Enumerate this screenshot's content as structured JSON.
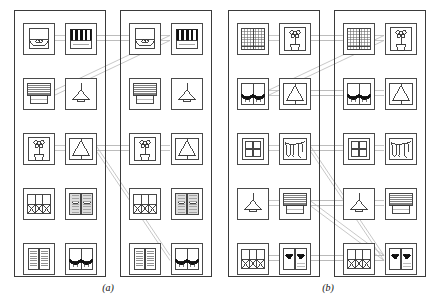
{
  "figure": {
    "type": "retrieval-results-comparison",
    "background_color": "#ffffff",
    "line_color": "#b9b9b9",
    "stroke_color": "#3a3a3a",
    "width": 440,
    "height": 302
  },
  "captions": [
    {
      "id": "a",
      "label": "(a)",
      "x": 108,
      "y": 282
    },
    {
      "id": "b",
      "label": "(b)",
      "x": 328,
      "y": 282
    }
  ],
  "panels": [
    {
      "id": "a",
      "label": "(a)",
      "columns": [
        {
          "id": "a-left",
          "name": "panel-a-query-column",
          "x": 14,
          "y": 10,
          "w": 90,
          "h": 265,
          "cells": [
            {
              "row": 0,
              "col": 0,
              "icon": "roman-shade-scalloped-icon",
              "label": "roman shade"
            },
            {
              "row": 0,
              "col": 1,
              "icon": "striped-awning-black-icon",
              "label": "black striped awning"
            },
            {
              "row": 1,
              "col": 0,
              "icon": "venetian-blind-slats-icon",
              "label": "venetian blind"
            },
            {
              "row": 1,
              "col": 1,
              "icon": "pendant-lamp-icon",
              "label": "pendant lamp"
            },
            {
              "row": 2,
              "col": 0,
              "icon": "potted-flower-window-icon",
              "label": "potted flower in window"
            },
            {
              "row": 2,
              "col": 1,
              "icon": "tent-awning-triangle-icon",
              "label": "triangular tent awning"
            },
            {
              "row": 3,
              "col": 0,
              "icon": "lattice-cross-window-icon",
              "label": "lattice cross window"
            },
            {
              "row": 3,
              "col": 1,
              "icon": "textured-drapes-pair-icon",
              "label": "textured drape pair"
            },
            {
              "row": 4,
              "col": 0,
              "icon": "louvered-shutters-icon",
              "label": "louvered shutters"
            },
            {
              "row": 4,
              "col": 1,
              "icon": "swag-valance-pair-icon",
              "label": "swag valance pair"
            }
          ]
        },
        {
          "id": "a-right",
          "name": "panel-a-result-column",
          "x": 120,
          "y": 10,
          "w": 90,
          "h": 265,
          "cells": [
            {
              "row": 0,
              "col": 0,
              "icon": "roman-shade-scalloped-icon",
              "label": "roman shade"
            },
            {
              "row": 0,
              "col": 1,
              "icon": "striped-awning-black-icon",
              "label": "black striped awning"
            },
            {
              "row": 1,
              "col": 0,
              "icon": "venetian-blind-slats-icon",
              "label": "venetian blind"
            },
            {
              "row": 1,
              "col": 1,
              "icon": "pendant-lamp-icon",
              "label": "pendant lamp"
            },
            {
              "row": 2,
              "col": 0,
              "icon": "potted-flower-window-icon",
              "label": "potted flower in window"
            },
            {
              "row": 2,
              "col": 1,
              "icon": "tent-awning-triangle-icon",
              "label": "triangular tent awning"
            },
            {
              "row": 3,
              "col": 0,
              "icon": "lattice-cross-window-icon",
              "label": "lattice cross window"
            },
            {
              "row": 3,
              "col": 1,
              "icon": "textured-drapes-pair-icon",
              "label": "textured drape pair"
            },
            {
              "row": 4,
              "col": 0,
              "icon": "louvered-shutters-icon",
              "label": "louvered shutters"
            },
            {
              "row": 4,
              "col": 1,
              "icon": "swag-valance-pair-icon",
              "label": "swag valance pair"
            }
          ]
        }
      ]
    },
    {
      "id": "b",
      "label": "(b)",
      "columns": [
        {
          "id": "b-left",
          "name": "panel-b-query-column",
          "x": 228,
          "y": 10,
          "w": 90,
          "h": 265,
          "cells": [
            {
              "row": 0,
              "col": 0,
              "icon": "grid-sheer-curtain-icon",
              "label": "grid sheer curtain"
            },
            {
              "row": 0,
              "col": 1,
              "icon": "potted-flower-window-icon",
              "label": "potted flower in window"
            },
            {
              "row": 1,
              "col": 0,
              "icon": "swag-valance-pair-icon",
              "label": "swag valance pair"
            },
            {
              "row": 1,
              "col": 1,
              "icon": "tent-awning-triangle-icon",
              "label": "triangular tent awning"
            },
            {
              "row": 2,
              "col": 0,
              "icon": "four-pane-window-icon",
              "label": "four pane window"
            },
            {
              "row": 2,
              "col": 1,
              "icon": "draped-swag-curtain-icon",
              "label": "draped swag curtain"
            },
            {
              "row": 3,
              "col": 0,
              "icon": "pendant-lamp-icon",
              "label": "pendant lamp"
            },
            {
              "row": 3,
              "col": 1,
              "icon": "venetian-blind-slats-icon",
              "label": "venetian blind"
            },
            {
              "row": 4,
              "col": 0,
              "icon": "lattice-cross-window-icon",
              "label": "lattice cross window"
            },
            {
              "row": 4,
              "col": 1,
              "icon": "heart-shutters-icon",
              "label": "heart shutters"
            }
          ]
        },
        {
          "id": "b-right",
          "name": "panel-b-result-column",
          "x": 334,
          "y": 10,
          "w": 90,
          "h": 265,
          "cells": [
            {
              "row": 0,
              "col": 0,
              "icon": "grid-sheer-curtain-icon",
              "label": "grid sheer curtain"
            },
            {
              "row": 0,
              "col": 1,
              "icon": "potted-flower-window-icon",
              "label": "potted flower in window"
            },
            {
              "row": 1,
              "col": 0,
              "icon": "swag-valance-pair-icon",
              "label": "swag valance pair"
            },
            {
              "row": 1,
              "col": 1,
              "icon": "tent-awning-triangle-icon",
              "label": "triangular tent awning"
            },
            {
              "row": 2,
              "col": 0,
              "icon": "four-pane-window-icon",
              "label": "four pane window"
            },
            {
              "row": 2,
              "col": 1,
              "icon": "draped-swag-curtain-icon",
              "label": "draped swag curtain"
            },
            {
              "row": 3,
              "col": 0,
              "icon": "pendant-lamp-icon",
              "label": "pendant lamp"
            },
            {
              "row": 3,
              "col": 1,
              "icon": "venetian-blind-slats-icon",
              "label": "venetian blind"
            },
            {
              "row": 4,
              "col": 0,
              "icon": "lattice-cross-window-icon",
              "label": "lattice cross window"
            },
            {
              "row": 4,
              "col": 1,
              "icon": "heart-shutters-icon",
              "label": "heart shutters"
            }
          ]
        }
      ]
    }
  ],
  "geometry": {
    "cell_w": 32,
    "cell_h": 32,
    "col_pad_x": 8,
    "col_gap_x": 42,
    "row_start_y": 12,
    "row_gap_y": 55
  },
  "links": [
    {
      "panel": "a",
      "from": [
        0,
        1
      ],
      "to": [
        0,
        1
      ]
    },
    {
      "panel": "a",
      "from": [
        0,
        0
      ],
      "to": [
        0,
        0
      ]
    },
    {
      "panel": "a",
      "from": [
        1,
        0
      ],
      "to": [
        0,
        1
      ]
    },
    {
      "panel": "a",
      "from": [
        2,
        0
      ],
      "to": [
        2,
        0
      ]
    },
    {
      "panel": "a",
      "from": [
        2,
        1
      ],
      "to": [
        2,
        1
      ]
    },
    {
      "panel": "a",
      "from": [
        2,
        1
      ],
      "to": [
        4,
        1
      ]
    },
    {
      "panel": "b",
      "from": [
        0,
        0
      ],
      "to": [
        0,
        0
      ]
    },
    {
      "panel": "b",
      "from": [
        0,
        1
      ],
      "to": [
        0,
        1
      ]
    },
    {
      "panel": "b",
      "from": [
        1,
        0
      ],
      "to": [
        0,
        1
      ]
    },
    {
      "panel": "b",
      "from": [
        1,
        0
      ],
      "to": [
        1,
        0
      ]
    },
    {
      "panel": "b",
      "from": [
        1,
        1
      ],
      "to": [
        1,
        1
      ]
    },
    {
      "panel": "b",
      "from": [
        2,
        0
      ],
      "to": [
        2,
        0
      ]
    },
    {
      "panel": "b",
      "from": [
        2,
        1
      ],
      "to": [
        2,
        1
      ]
    },
    {
      "panel": "b",
      "from": [
        2,
        1
      ],
      "to": [
        4,
        1
      ]
    },
    {
      "panel": "b",
      "from": [
        3,
        0
      ],
      "to": [
        3,
        0
      ]
    },
    {
      "panel": "b",
      "from": [
        3,
        1
      ],
      "to": [
        3,
        1
      ]
    },
    {
      "panel": "b",
      "from": [
        3,
        1
      ],
      "to": [
        4,
        1
      ]
    },
    {
      "panel": "b",
      "from": [
        4,
        0
      ],
      "to": [
        4,
        0
      ]
    },
    {
      "panel": "b",
      "from": [
        4,
        1
      ],
      "to": [
        4,
        1
      ]
    },
    {
      "panel": "b",
      "from": [
        4,
        0
      ],
      "to": [
        4,
        1
      ]
    }
  ]
}
